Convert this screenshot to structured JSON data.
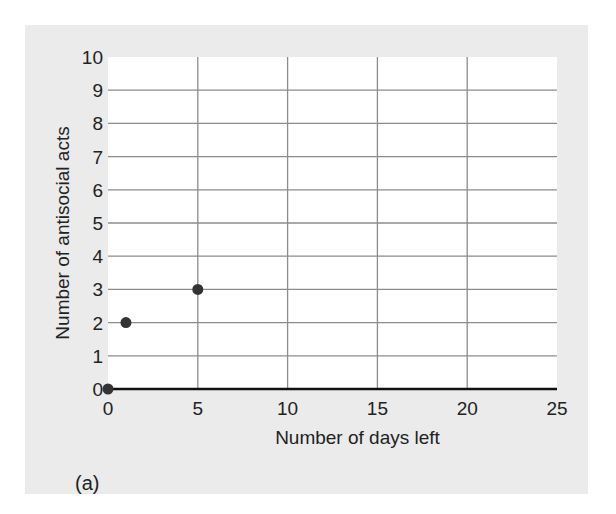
{
  "chart_data": {
    "type": "scatter",
    "title": "",
    "panel_label": "(a)",
    "xlabel": "Number of days left",
    "ylabel": "Number of antisocial acts",
    "xlim": [
      0,
      25
    ],
    "ylim": [
      0,
      10
    ],
    "xticks": [
      0,
      5,
      10,
      15,
      20,
      25
    ],
    "yticks": [
      0,
      1,
      2,
      3,
      4,
      5,
      6,
      7,
      8,
      9,
      10
    ],
    "grid": true,
    "legend": null,
    "series": [
      {
        "name": "antisocial acts",
        "color": "#333333",
        "points": [
          {
            "x": 0,
            "y": 0
          },
          {
            "x": 1,
            "y": 2
          },
          {
            "x": 5,
            "y": 3
          }
        ]
      }
    ]
  },
  "colors": {
    "panel_background": "#ebebeb",
    "plot_background": "#ffffff",
    "gridline": "#8c8c8c",
    "axis": "#111111",
    "marker": "#333333"
  }
}
